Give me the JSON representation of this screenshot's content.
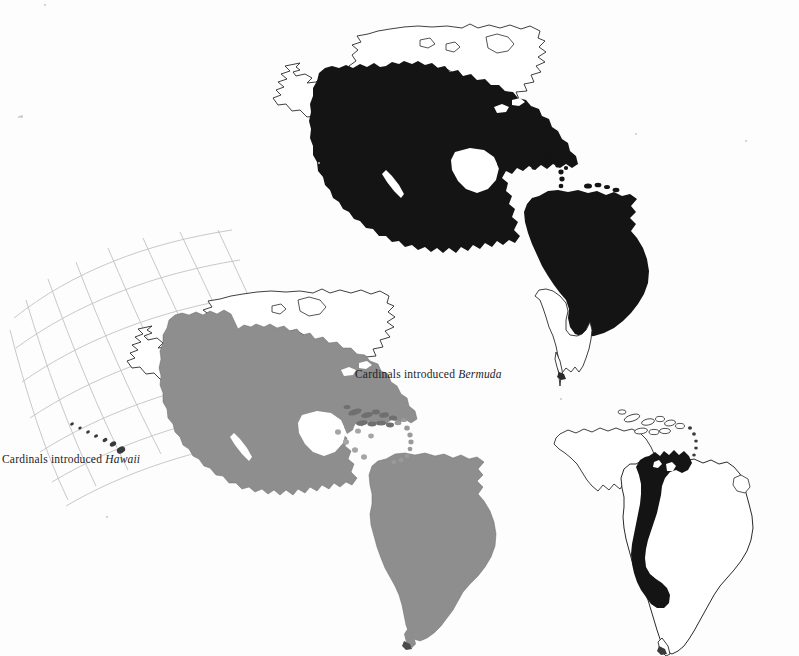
{
  "figure": {
    "kind": "distribution-map-plate",
    "background_color": "#fdfdfd",
    "ink_color": "#111111",
    "fill_black": "#141414",
    "fill_gray": "#8e8e8e",
    "graticule_color": "#c2c2c2",
    "outline_color": "#2a2a2a"
  },
  "captions": {
    "bermuda": {
      "lead": "Cardinals introduced ",
      "place": "Bermuda"
    },
    "hawaii": {
      "lead": "Cardinals introduced ",
      "place": "Hawaii"
    }
  },
  "maps": [
    {
      "id": "map-north",
      "name": "northern-cardinal-range-map",
      "region": "Americas",
      "shading": "solid-black",
      "filled_area": "United States, Mexico, Central America, Caribbean islands, northern and central South America",
      "unfilled_area": "Alaska, Canada, Greenland margin, southern Chile and Argentina",
      "graticule": false
    },
    {
      "id": "map-mid",
      "name": "secondary-cardinal-range-map",
      "region": "Americas with Hawaii inset",
      "shading": "solid-gray",
      "filled_area": "United States, Mexico, Central America, Caribbean islands, all of South America",
      "unfilled_area": "Alaska, Canada",
      "graticule": true
    },
    {
      "id": "map-se",
      "name": "andean-cardinal-range-map",
      "region": "South America",
      "shading": "solid-black-band",
      "filled_area": "Andean belt from Venezuela and Colombia south through Ecuador, Peru and Bolivia",
      "unfilled_area": "Central America, Caribbean, Brazil, Argentina, Chile",
      "graticule": false
    }
  ]
}
